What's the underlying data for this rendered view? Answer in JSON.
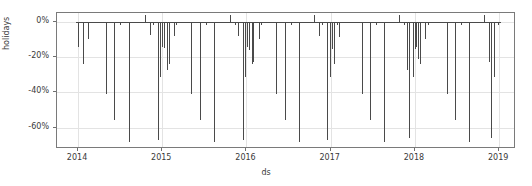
{
  "chart_data": {
    "type": "bar",
    "title": "",
    "subtitle": "",
    "xlabel": "ds",
    "ylabel": "holidays",
    "grid": true,
    "legend": null,
    "xlim": [
      "2013-10-01",
      "2019-03-15"
    ],
    "ylim": [
      -0.72,
      0.05
    ],
    "ytick_labels": [
      "0%",
      "-20%",
      "-40%",
      "-60%"
    ],
    "ytick_values": [
      0,
      -20,
      -40,
      -60
    ],
    "xtick_labels": [
      "2014",
      "2015",
      "2016",
      "2017",
      "2018",
      "2019"
    ],
    "xtick_values": [
      2014,
      2015,
      2016,
      2017,
      2018,
      2019
    ],
    "series_name": "holidays",
    "bar_color": "#4a4a4a",
    "grid_color": "#e3e3e3",
    "frame_color": "#7a7a7a",
    "note": "Values are effect in percent; x positions are fractional years.",
    "points": [
      {
        "x": 2014.005,
        "y": -14.5
      },
      {
        "x": 2014.055,
        "y": -24.0
      },
      {
        "x": 2014.12,
        "y": -9.5
      },
      {
        "x": 2014.33,
        "y": -41.0
      },
      {
        "x": 2014.43,
        "y": -55.5
      },
      {
        "x": 2014.495,
        "y": -2.0
      },
      {
        "x": 2014.6,
        "y": -68.0
      },
      {
        "x": 2014.79,
        "y": 4.0
      },
      {
        "x": 2014.85,
        "y": -7.5
      },
      {
        "x": 2014.885,
        "y": -2.0
      },
      {
        "x": 2014.945,
        "y": -67.0
      },
      {
        "x": 2014.975,
        "y": -31.0
      },
      {
        "x": 2015.0,
        "y": -14.0
      },
      {
        "x": 2015.02,
        "y": -15.0
      },
      {
        "x": 2015.055,
        "y": -27.5
      },
      {
        "x": 2015.075,
        "y": -24.0
      },
      {
        "x": 2015.135,
        "y": -8.0
      },
      {
        "x": 2015.16,
        "y": -2.0
      },
      {
        "x": 2015.345,
        "y": -41.0
      },
      {
        "x": 2015.45,
        "y": -55.5
      },
      {
        "x": 2015.52,
        "y": -2.0
      },
      {
        "x": 2015.615,
        "y": -68.0
      },
      {
        "x": 2015.8,
        "y": 4.0
      },
      {
        "x": 2015.86,
        "y": -2.0
      },
      {
        "x": 2015.905,
        "y": -8.0
      },
      {
        "x": 2015.955,
        "y": -67.0
      },
      {
        "x": 2015.985,
        "y": -31.0
      },
      {
        "x": 2016.01,
        "y": -14.0
      },
      {
        "x": 2016.03,
        "y": -16.0
      },
      {
        "x": 2016.06,
        "y": -24.0
      },
      {
        "x": 2016.08,
        "y": -22.5
      },
      {
        "x": 2016.15,
        "y": -9.5
      },
      {
        "x": 2016.175,
        "y": -2.0
      },
      {
        "x": 2016.355,
        "y": -41.0
      },
      {
        "x": 2016.46,
        "y": -55.5
      },
      {
        "x": 2016.53,
        "y": -2.0
      },
      {
        "x": 2016.625,
        "y": -68.0
      },
      {
        "x": 2016.805,
        "y": 4.0
      },
      {
        "x": 2016.865,
        "y": -8.0
      },
      {
        "x": 2016.895,
        "y": -2.0
      },
      {
        "x": 2016.96,
        "y": -67.0
      },
      {
        "x": 2016.99,
        "y": -31.0
      },
      {
        "x": 2017.015,
        "y": -15.5
      },
      {
        "x": 2017.035,
        "y": -24.0
      },
      {
        "x": 2017.07,
        "y": -2.0
      },
      {
        "x": 2017.1,
        "y": -8.5
      },
      {
        "x": 2017.37,
        "y": -41.0
      },
      {
        "x": 2017.47,
        "y": -55.5
      },
      {
        "x": 2017.54,
        "y": -2.0
      },
      {
        "x": 2017.635,
        "y": -68.0
      },
      {
        "x": 2017.81,
        "y": 4.0
      },
      {
        "x": 2017.87,
        "y": -2.0
      },
      {
        "x": 2017.905,
        "y": -27.5
      },
      {
        "x": 2017.935,
        "y": -66.0
      },
      {
        "x": 2017.975,
        "y": -31.0
      },
      {
        "x": 2018.0,
        "y": -15.5
      },
      {
        "x": 2018.015,
        "y": -14.0
      },
      {
        "x": 2018.04,
        "y": -21.0
      },
      {
        "x": 2018.06,
        "y": -24.0
      },
      {
        "x": 2018.125,
        "y": -9.5
      },
      {
        "x": 2018.15,
        "y": -2.0
      },
      {
        "x": 2018.38,
        "y": -41.0
      },
      {
        "x": 2018.48,
        "y": -55.5
      },
      {
        "x": 2018.55,
        "y": -2.0
      },
      {
        "x": 2018.645,
        "y": -68.0
      },
      {
        "x": 2018.82,
        "y": 4.0
      },
      {
        "x": 2018.88,
        "y": -22.5
      },
      {
        "x": 2018.905,
        "y": -66.0
      },
      {
        "x": 2018.935,
        "y": -31.0
      },
      {
        "x": 2018.985,
        "y": -2.0
      }
    ]
  }
}
